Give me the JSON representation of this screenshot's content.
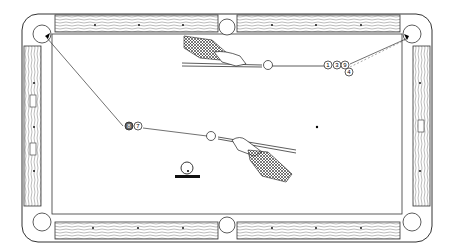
{
  "illustration": {
    "subject": "pool-table-shot-diagram",
    "upper_shot": {
      "balls": [
        {
          "label": "1"
        },
        {
          "label": "3"
        },
        {
          "label": "9"
        },
        {
          "label": "4"
        }
      ]
    },
    "lower_shot": {
      "balls": [
        {
          "label": "8"
        },
        {
          "label": "7"
        }
      ]
    },
    "legend_symbol": "cue-ball-position-marker"
  }
}
